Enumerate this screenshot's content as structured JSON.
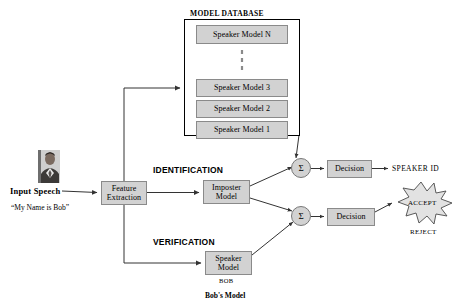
{
  "diagram": {
    "database": {
      "title": "MODEL DATABASE",
      "models": [
        {
          "label": "Speaker Model N"
        },
        {
          "label": "Speaker Model 3"
        },
        {
          "label": "Speaker Model 2"
        },
        {
          "label": "Speaker Model 1"
        }
      ],
      "ellipsis": "vertical-dashed-ellipsis"
    },
    "input": {
      "person_icon": "person-photo-icon",
      "label": "Input Speech",
      "quote": "“My Name is Bob”"
    },
    "blocks": {
      "feature_extraction": {
        "line1": "Feature",
        "line2": "Extraction"
      },
      "imposter_model": {
        "line1": "Imposter",
        "line2": "Model"
      },
      "speaker_model": {
        "line1": "Speaker",
        "line2": "Model"
      },
      "decision_top": {
        "label": "Decision"
      },
      "decision_bottom": {
        "label": "Decision"
      }
    },
    "summers": {
      "top": {
        "symbol": "Σ"
      },
      "bottom": {
        "symbol": "Σ"
      }
    },
    "phases": {
      "identification": "IDENTIFICATION",
      "verification": "VERIFICATION"
    },
    "outputs": {
      "speaker_id": "SPEAKER ID",
      "accept": "ACCEPT",
      "reject": "REJECT"
    },
    "annotations": {
      "bob_tag": "BOB",
      "bobs_model": "Bob's Model"
    },
    "colors": {
      "box_fill": "#d2d2d2",
      "box_border": "#8a8a8a",
      "frame_border": "#000000",
      "wire": "#333333",
      "background": "#ffffff"
    }
  }
}
